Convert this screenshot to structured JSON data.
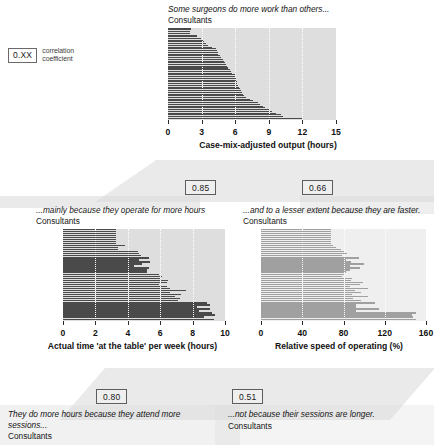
{
  "legend": {
    "value": "0.XX",
    "line1": "correlation",
    "line2": "coefficient"
  },
  "panels": {
    "top": {
      "caption": "Some surgeons do more work than others...",
      "subtitle": "Consultants",
      "corr": null
    },
    "mid_left": {
      "caption": "...mainly because they operate for more hours",
      "subtitle": "Consultants",
      "corr": "0.85"
    },
    "mid_right": {
      "caption": "...and to a lesser extent because they are faster.",
      "subtitle": "Consultants",
      "corr": "0.66"
    },
    "bottom_left": {
      "caption": "They do more hours because they attend more sessions...",
      "subtitle": "Consultants",
      "corr": "0.80"
    },
    "bottom_right": {
      "caption": "...not because their sessions are longer.",
      "subtitle": "Consultants",
      "corr": "0.51"
    }
  },
  "colors": {
    "bar_dark": "#4a4a4a",
    "bar_light": "#a0a0a0",
    "plot_bg_dark": "#dedede",
    "plot_bg_light": "#efefef",
    "gridline": "#ffffff"
  },
  "chart_data": [
    {
      "id": "case-mix-adjusted-output",
      "type": "bar",
      "orientation": "horizontal",
      "title": "Some surgeons do more work than others...",
      "subtitle": "Consultants",
      "xlabel": "Case-mix-adjusted output (hours)",
      "ylabel": "",
      "xlim": [
        0,
        15
      ],
      "ticks": [
        0,
        3,
        6,
        9,
        12,
        15
      ],
      "grid": true,
      "sorted": true,
      "bar_color": "#4a4a4a",
      "values": [
        2.05,
        2.05,
        2.0,
        1.95,
        2.6,
        2.6,
        2.95,
        3.1,
        3.25,
        3.4,
        3.6,
        3.95,
        4.3,
        4.35,
        4.45,
        4.5,
        4.6,
        4.7,
        4.9,
        5.0,
        5.1,
        5.2,
        5.3,
        5.4,
        5.5,
        5.6,
        5.75,
        6.0,
        6.0,
        6.05,
        6.1,
        6.15,
        6.2,
        6.25,
        6.3,
        6.4,
        6.5,
        6.6,
        6.7,
        6.8,
        6.95,
        7.3,
        7.6,
        8.0,
        8.2,
        8.5,
        8.7,
        9.1,
        9.3,
        9.6,
        10.1,
        10.3,
        12.0
      ]
    },
    {
      "id": "actual-time-at-the-table",
      "type": "bar",
      "orientation": "horizontal",
      "title": "...mainly because they operate for more hours",
      "subtitle": "Consultants",
      "xlabel": "Actual time 'at the table' per week (hours)",
      "ylabel": "",
      "xlim": [
        0,
        10
      ],
      "ticks": [
        0,
        2,
        4,
        6,
        8,
        10
      ],
      "grid": true,
      "sorted": false,
      "correlation": 0.85,
      "bar_color": "#4a4a4a",
      "values": [
        3.3,
        3.3,
        3.3,
        3.3,
        3.3,
        3.3,
        3.3,
        3.3,
        3.8,
        3.4,
        3.4,
        4.6,
        4.7,
        4.8,
        5.3,
        4.7,
        5.4,
        4.9,
        4.4,
        5.3,
        5.2,
        5.2,
        5.9,
        6.1,
        6.0,
        6.5,
        6.4,
        5.9,
        6.4,
        6.6,
        7.6,
        6.6,
        7.3,
        6.9,
        7.2,
        7.1,
        8.9,
        9.1,
        8.3,
        9.1,
        8.4,
        9.2,
        9.4,
        8.7,
        9.3
      ]
    },
    {
      "id": "relative-speed-of-operating",
      "type": "bar",
      "orientation": "horizontal",
      "title": "...and to a lesser extent because they are faster.",
      "subtitle": "Consultants",
      "xlabel": "Relative speed of operating (%)",
      "ylabel": "",
      "xlim": [
        0,
        160
      ],
      "ticks": [
        0,
        40,
        80,
        120,
        160
      ],
      "grid": true,
      "sorted": false,
      "correlation": 0.66,
      "bar_color": "#a0a0a0",
      "values": [
        68,
        68,
        68,
        68,
        68,
        68,
        68,
        68,
        70,
        73,
        78,
        80,
        83,
        79,
        95,
        82,
        87,
        100,
        86,
        96,
        86,
        82,
        81,
        79,
        88,
        87,
        99,
        96,
        86,
        104,
        91,
        97,
        88,
        104,
        89,
        97,
        111,
        92,
        92,
        114,
        92,
        150,
        146,
        147,
        150
      ]
    }
  ]
}
